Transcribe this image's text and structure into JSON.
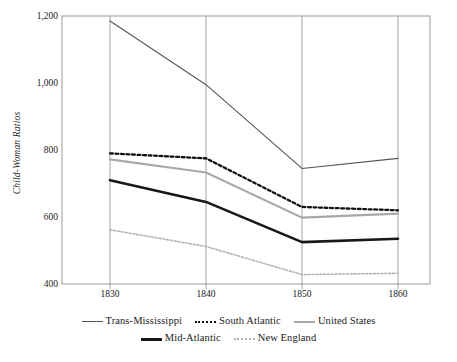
{
  "chart_data": {
    "type": "line",
    "title": "",
    "xlabel": "",
    "ylabel": "Child-Woman Ratios",
    "x": [
      1830,
      1840,
      1850,
      1860
    ],
    "xtick_labels": [
      "1830",
      "1840",
      "1850",
      "1860"
    ],
    "ytick_labels": [
      "1,200",
      "1,000",
      "800",
      "600",
      "400"
    ],
    "ytick_values": [
      1200,
      1000,
      800,
      600,
      400
    ],
    "ylim": [
      400,
      1200
    ],
    "xlim": [
      1825,
      1865
    ],
    "grid": "vertical-only",
    "legend_position": "bottom",
    "series": [
      {
        "name": "Trans-Mississippi",
        "values": [
          1185,
          995,
          745,
          775
        ],
        "color": "#555555",
        "width": 1.1,
        "dash": "none"
      },
      {
        "name": "South Atlantic",
        "values": [
          790,
          775,
          630,
          620
        ],
        "color": "#111111",
        "width": 2.3,
        "dash": "dotted"
      },
      {
        "name": "United States",
        "values": [
          772,
          733,
          598,
          610
        ],
        "color": "#a8a8a8",
        "width": 2.1,
        "dash": "none"
      },
      {
        "name": "Mid-Atlantic",
        "values": [
          710,
          645,
          525,
          535
        ],
        "color": "#181818",
        "width": 2.6,
        "dash": "none"
      },
      {
        "name": "New England",
        "values": [
          562,
          512,
          428,
          432
        ],
        "color": "#b4b4b4",
        "width": 1.6,
        "dash": "dotted"
      }
    ]
  },
  "legend": {
    "rows": [
      [
        "Trans-Mississippi",
        "South Atlantic",
        "United States"
      ],
      [
        "Mid-Atlantic",
        "New England"
      ]
    ]
  },
  "colors": {
    "frame": "#9a9a9a",
    "gridline": "#9a9a9a",
    "axis_text": "#1b1b1b",
    "background": "#ffffff"
  }
}
